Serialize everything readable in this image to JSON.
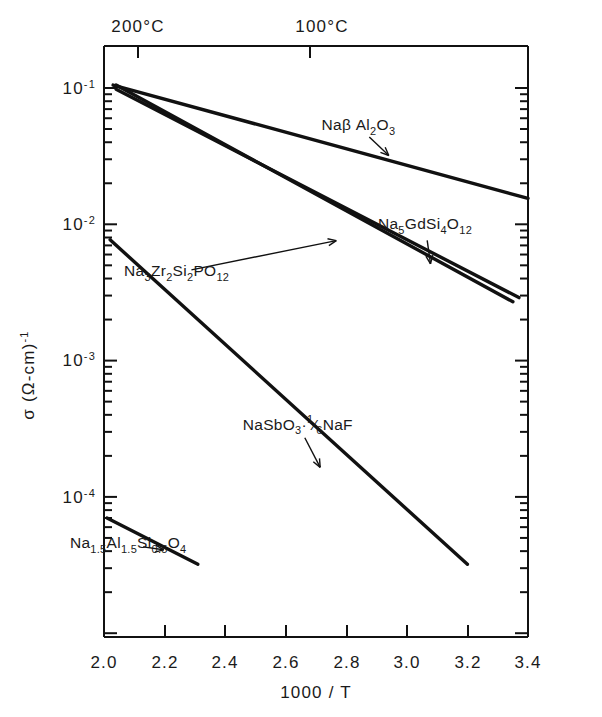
{
  "chart_data": {
    "type": "line",
    "title": "",
    "xlabel": "1000 / T",
    "ylabel": "σ (Ω-cm)⁻¹",
    "xlim": [
      2.0,
      3.4
    ],
    "ylim": [
      3.2e-05,
      0.16
    ],
    "yscale": "log",
    "grid": false,
    "legend": "annotations-on-curves",
    "x_ticks": [
      "2.0",
      "2.2",
      "2.4",
      "2.6",
      "2.8",
      "3.0",
      "3.2",
      "3.4"
    ],
    "x_tick_values": [
      2.0,
      2.2,
      2.4,
      2.6,
      2.8,
      3.0,
      3.2,
      3.4
    ],
    "y_ticks": [
      "10⁻¹",
      "10⁻²",
      "10⁻³",
      "10⁻⁴"
    ],
    "y_tick_values": [
      0.1,
      0.01,
      0.001,
      0.0001
    ],
    "secondary_axis": {
      "position": "top",
      "label": "",
      "ticks": [
        {
          "label": "200°C",
          "x_value": 2.114
        },
        {
          "label": "100°C",
          "x_value": 2.681
        }
      ]
    },
    "series": [
      {
        "name": "Naβ Al₂O₃",
        "label_html": "Naβ Al<sub>2</sub>O<sub>3</sub>",
        "points": [
          [
            2.03,
            0.105
          ],
          [
            3.4,
            0.0155
          ]
        ],
        "label_x": 2.84,
        "label_y": 0.052,
        "arrow_to": [
          2.95,
          0.0305
        ]
      },
      {
        "name": "Na₅GdSi₄O₁₂",
        "label_html": "Na<sub>5</sub>GdSi<sub>4</sub>O<sub>12</sub>",
        "points": [
          [
            2.04,
            0.098
          ],
          [
            3.37,
            0.0029
          ]
        ],
        "label_x": 3.06,
        "label_y": 0.0098,
        "arrow_to": [
          3.08,
          0.0048
        ]
      },
      {
        "name": "Na₃Zr₂Si₂PO₁₂",
        "label_html": "Na<sub>3</sub>Zr<sub>2</sub>Si<sub>2</sub>PO<sub>12</sub>",
        "points": [
          [
            2.04,
            0.105
          ],
          [
            3.35,
            0.0027
          ]
        ],
        "label_x": 2.24,
        "label_y": 0.0044,
        "arrow_to": [
          2.78,
          0.0077
        ]
      },
      {
        "name": "NaSbO₃·⅙NaF",
        "label_html": "NaSbO<sub>3</sub>·<sup>1</sup>⁄<sub>6</sub>NaF",
        "points": [
          [
            2.02,
            0.0077
          ],
          [
            3.2,
            3.2e-05
          ]
        ],
        "label_x": 2.64,
        "label_y": 0.00034,
        "arrow_to": [
          2.72,
          0.000155
        ]
      },
      {
        "name": "Na₁.₅Al₁.₅Si₀.₅O₄",
        "label_html": "Na<sub>1.5</sub>Al<sub>1.5</sub>Si<sub>0.5</sub>O<sub>4</sub>",
        "points": [
          [
            2.01,
            7e-05
          ],
          [
            2.31,
            3.2e-05
          ]
        ],
        "label_x": 2.08,
        "label_y": 4.45e-05,
        "arrow_to": [
          2.21,
          4.05e-05
        ]
      }
    ]
  },
  "axes": {
    "y_axis_label": "σ (Ω-cm)⁻¹",
    "x_axis_label": "1000 / T"
  }
}
